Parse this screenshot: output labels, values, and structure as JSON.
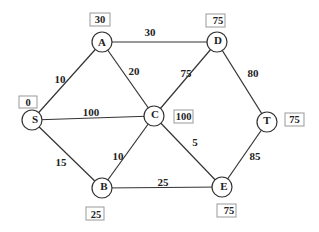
{
  "graph": {
    "nodes": [
      {
        "id": "A",
        "label": "A",
        "distance": "30"
      },
      {
        "id": "D",
        "label": "D",
        "distance": "75"
      },
      {
        "id": "S",
        "label": "S",
        "distance": "0"
      },
      {
        "id": "C",
        "label": "C",
        "distance": "100"
      },
      {
        "id": "T",
        "label": "T",
        "distance": "75"
      },
      {
        "id": "B",
        "label": "B",
        "distance": "25"
      },
      {
        "id": "E",
        "label": "E",
        "distance": "75"
      }
    ],
    "edges": [
      {
        "from": "S",
        "to": "A",
        "weight": "10"
      },
      {
        "from": "A",
        "to": "D",
        "weight": "30"
      },
      {
        "from": "A",
        "to": "C",
        "weight": "20"
      },
      {
        "from": "S",
        "to": "C",
        "weight": "100"
      },
      {
        "from": "C",
        "to": "D",
        "weight": "75"
      },
      {
        "from": "D",
        "to": "T",
        "weight": "80"
      },
      {
        "from": "S",
        "to": "B",
        "weight": "15"
      },
      {
        "from": "B",
        "to": "C",
        "weight": "10"
      },
      {
        "from": "C",
        "to": "E",
        "weight": "5"
      },
      {
        "from": "B",
        "to": "E",
        "weight": "25"
      },
      {
        "from": "E",
        "to": "T",
        "weight": "85"
      }
    ]
  }
}
